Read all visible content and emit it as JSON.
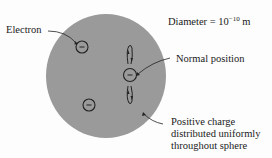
{
  "diagram": {
    "labels": {
      "electron": "Electron",
      "diameter_prefix": "Diameter = 10",
      "diameter_exponent": "−10",
      "diameter_unit": "m",
      "normal_position": "Normal position",
      "positive_charge_line1": "Positive charge",
      "positive_charge_line2": "distributed uniformly",
      "positive_charge_line3": "throughout sphere"
    },
    "electron_symbol": "−",
    "colors": {
      "sphere_fill": "#9a9a9a",
      "outline": "#222222",
      "text": "#1a1a1a",
      "background": "#fdfdfd"
    }
  }
}
